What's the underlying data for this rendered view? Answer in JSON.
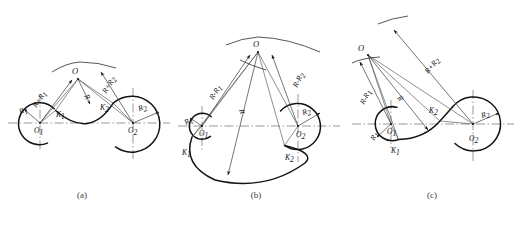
{
  "figure": {
    "background_color": "#ffffff",
    "line_color": "#131313",
    "panels": [
      {
        "id": "a",
        "caption": "(a)",
        "description": "External tangency on both circles: connecting arc radius R touches circle 1 and circle 2 externally",
        "center_label": "O",
        "labels": [
          {
            "name": "R1",
            "text": "R",
            "sub": "1"
          },
          {
            "name": "R2",
            "text": "R",
            "sub": "2"
          },
          {
            "name": "R",
            "text": "R",
            "sub": ""
          },
          {
            "name": "K1",
            "text": "K",
            "sub": "1"
          },
          {
            "name": "K2",
            "text": "K",
            "sub": "2"
          },
          {
            "name": "O1",
            "text": "O",
            "sub": "1"
          },
          {
            "name": "O2",
            "text": "O",
            "sub": "2"
          },
          {
            "name": "R-plus-R1",
            "text": "R+R",
            "sub": "1"
          },
          {
            "name": "R-plus-R2",
            "text": "R+R",
            "sub": "2"
          }
        ]
      },
      {
        "id": "b",
        "caption": "(b)",
        "description": "Internal tangency on both circles: connecting arc radius R encloses circle 1 and circle 2",
        "center_label": "O",
        "labels": [
          {
            "name": "R1",
            "text": "R",
            "sub": "1"
          },
          {
            "name": "R2",
            "text": "R",
            "sub": "2"
          },
          {
            "name": "R",
            "text": "R",
            "sub": ""
          },
          {
            "name": "K1",
            "text": "K",
            "sub": "1"
          },
          {
            "name": "K2",
            "text": "K",
            "sub": "2"
          },
          {
            "name": "O1",
            "text": "O",
            "sub": "1"
          },
          {
            "name": "O2",
            "text": "O",
            "sub": "2"
          },
          {
            "name": "R-minus-R1",
            "text": "R-R",
            "sub": "1"
          },
          {
            "name": "R-minus-R2",
            "text": "R-R",
            "sub": "2"
          }
        ]
      },
      {
        "id": "c",
        "caption": "(c)",
        "description": "Mixed tangency: internal to circle 1 and external to circle 2",
        "center_label": "O",
        "labels": [
          {
            "name": "R1",
            "text": "R",
            "sub": "1"
          },
          {
            "name": "R2",
            "text": "R",
            "sub": "2"
          },
          {
            "name": "R",
            "text": "R",
            "sub": ""
          },
          {
            "name": "K1",
            "text": "K",
            "sub": "1"
          },
          {
            "name": "K2",
            "text": "K",
            "sub": "2"
          },
          {
            "name": "O1",
            "text": "O",
            "sub": "1"
          },
          {
            "name": "O2",
            "text": "O",
            "sub": "2"
          },
          {
            "name": "R-minus-R1",
            "text": "R-R",
            "sub": "1"
          },
          {
            "name": "R-plus-R2",
            "text": "R+R",
            "sub": "2"
          }
        ]
      }
    ]
  },
  "panel_a": {
    "caption": "(a)",
    "O": "O",
    "O1": "O",
    "O1s": "1",
    "O2": "O",
    "O2s": "2",
    "R": "R",
    "R1": "R",
    "R1s": "1",
    "R2": "R",
    "R2s": "2",
    "K1": "K",
    "K1s": "1",
    "K2": "K",
    "K2s": "2",
    "sumR1": "R+R",
    "sumR1s": "1",
    "sumR2": "R+R",
    "sumR2s": "2"
  },
  "panel_b": {
    "caption": "(b)",
    "O": "O",
    "O1": "O",
    "O1s": "1",
    "O2": "O",
    "O2s": "2",
    "R": "R",
    "R1": "R",
    "R1s": "1",
    "R2": "R",
    "R2s": "2",
    "K1": "K",
    "K1s": "1",
    "K2": "K",
    "K2s": "2",
    "difR1": "R-R",
    "difR1s": "1",
    "difR2": "R-R",
    "difR2s": "2"
  },
  "panel_c": {
    "caption": "(c)",
    "O": "O",
    "O1": "O",
    "O1s": "1",
    "O2": "O",
    "O2s": "2",
    "R": "R",
    "R1": "R",
    "R1s": "1",
    "R2": "R",
    "R2s": "2",
    "K1": "K",
    "K1s": "1",
    "K2": "K",
    "K2s": "2",
    "difR1": "R-R",
    "difR1s": "1",
    "sumR2": "R+R",
    "sumR2s": "2"
  }
}
